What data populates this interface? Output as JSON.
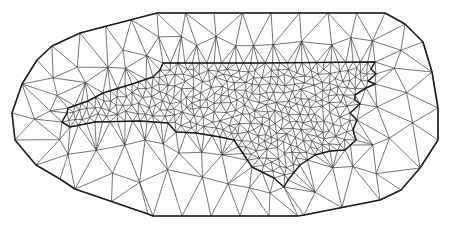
{
  "figure": {
    "title": "",
    "colors": {
      "background": "#ffffff",
      "mesh_edge": "#3a3a3a",
      "boundary": "#1e1e1e"
    },
    "regions": [
      {
        "name": "outer-domain",
        "refinement": "coarse"
      },
      {
        "name": "inner-region",
        "refinement": "fine"
      }
    ],
    "mesh": {
      "type": "triangulation",
      "method": "delaunay",
      "outer_points": 140,
      "inner_points": 430
    }
  }
}
